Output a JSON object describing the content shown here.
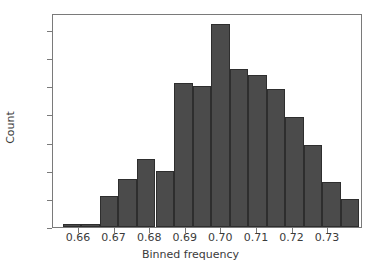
{
  "chart_data": {
    "type": "bar",
    "title": "",
    "xlabel": "Binned frequency",
    "ylabel": "Count",
    "bin_edges": [
      0.6555,
      0.6607,
      0.6659,
      0.6711,
      0.6763,
      0.6815,
      0.6867,
      0.6919,
      0.6971,
      0.7023,
      0.7075,
      0.7127,
      0.7179,
      0.7231,
      0.7283,
      0.7335,
      0.7387
    ],
    "bin_centers": [
      0.6581,
      0.6633,
      0.6685,
      0.6737,
      0.6789,
      0.6841,
      0.6893,
      0.6945,
      0.6997,
      0.7049,
      0.7101,
      0.7153,
      0.7205,
      0.7257,
      0.7309,
      0.7361
    ],
    "values": [
      1,
      1,
      11,
      17,
      24,
      20,
      51,
      50,
      72,
      56,
      54,
      49,
      39,
      29,
      16,
      10
    ],
    "xlim": [
      0.6527,
      0.7398
    ],
    "ylim": [
      0,
      76
    ],
    "xticks": [
      0.66,
      0.67,
      0.68,
      0.69,
      0.7,
      0.71,
      0.72,
      0.73
    ],
    "xtick_labels": [
      "0.66",
      "0.67",
      "0.68",
      "0.69",
      "0.70",
      "0.71",
      "0.72",
      "0.73"
    ],
    "yticks": [
      0,
      10,
      20,
      30,
      40,
      50,
      60,
      70
    ],
    "ytick_labels": [
      "0",
      "10",
      "20",
      "30",
      "40",
      "50",
      "60",
      "70"
    ],
    "grid": false,
    "legend": false,
    "bar_color": "#4b4b4b",
    "bar_edge_color": "#2e2e2e",
    "axis_color": "#7a7a7a",
    "text_color": "#3b3b3b",
    "background": "#ffffff"
  }
}
